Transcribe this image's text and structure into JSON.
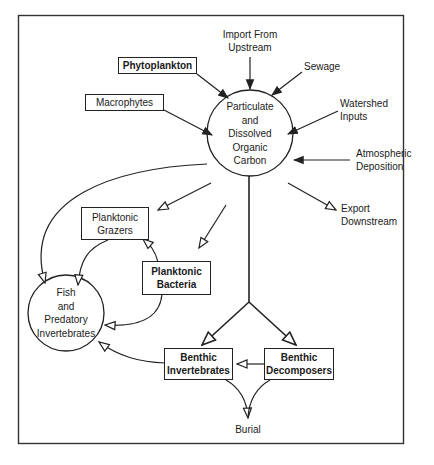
{
  "diagram": {
    "type": "flow-diagram",
    "title": "",
    "central_node": {
      "id": "poc-doc",
      "lines": [
        "Particulate",
        "and",
        "Dissolved",
        "Organic",
        "Carbon"
      ]
    },
    "consumer_node": {
      "id": "fish",
      "lines": [
        "Fish",
        "and",
        "Predatory",
        "Invertebrates"
      ]
    },
    "inputs": [
      {
        "id": "phytoplankton",
        "lines": [
          "Phytoplankton"
        ],
        "boxed": true
      },
      {
        "id": "macrophytes",
        "lines": [
          "Macrophytes"
        ],
        "boxed": true
      },
      {
        "id": "import",
        "lines": [
          "Import From",
          "Upstream"
        ],
        "boxed": false
      },
      {
        "id": "sewage",
        "lines": [
          "Sewage"
        ],
        "boxed": false
      },
      {
        "id": "watershed",
        "lines": [
          "Watershed",
          "Inputs"
        ],
        "boxed": false
      },
      {
        "id": "atmospheric",
        "lines": [
          "Atmospheric",
          "Deposition"
        ],
        "boxed": false
      }
    ],
    "outputs": [
      {
        "id": "export",
        "lines": [
          "Export",
          "Downstream"
        ],
        "boxed": false
      },
      {
        "id": "burial",
        "lines": [
          "Burial"
        ],
        "boxed": false
      }
    ],
    "compartments": [
      {
        "id": "grazers",
        "lines": [
          "Planktonic",
          "Grazers"
        ]
      },
      {
        "id": "bacteria",
        "lines": [
          "Planktonic",
          "Bacteria"
        ]
      },
      {
        "id": "benthic-invert",
        "lines": [
          "Benthic",
          "Invertebrates"
        ]
      },
      {
        "id": "benthic-decomp",
        "lines": [
          "Benthic",
          "Decomposers"
        ]
      }
    ],
    "edges": [
      {
        "from": "phytoplankton",
        "to": "poc-doc",
        "arrow": "solid"
      },
      {
        "from": "macrophytes",
        "to": "poc-doc",
        "arrow": "solid"
      },
      {
        "from": "import",
        "to": "poc-doc",
        "arrow": "solid"
      },
      {
        "from": "sewage",
        "to": "poc-doc",
        "arrow": "solid"
      },
      {
        "from": "watershed",
        "to": "poc-doc",
        "arrow": "solid"
      },
      {
        "from": "atmospheric",
        "to": "poc-doc",
        "arrow": "solid"
      },
      {
        "from": "poc-doc",
        "to": "export",
        "arrow": "open"
      },
      {
        "from": "poc-doc",
        "to": "grazers",
        "arrow": "open"
      },
      {
        "from": "poc-doc",
        "to": "bacteria",
        "arrow": "open"
      },
      {
        "from": "poc-doc",
        "to": "fish",
        "arrow": "open"
      },
      {
        "from": "poc-doc",
        "to": "benthic-invert",
        "arrow": "open"
      },
      {
        "from": "poc-doc",
        "to": "benthic-decomp",
        "arrow": "open"
      },
      {
        "from": "bacteria",
        "to": "grazers",
        "arrow": "open"
      },
      {
        "from": "grazers",
        "to": "fish",
        "arrow": "open"
      },
      {
        "from": "bacteria",
        "to": "fish",
        "arrow": "open"
      },
      {
        "from": "benthic-invert",
        "to": "fish",
        "arrow": "open"
      },
      {
        "from": "benthic-decomp",
        "to": "benthic-invert",
        "arrow": "open"
      },
      {
        "from": "benthic-invert",
        "to": "burial",
        "arrow": "open"
      },
      {
        "from": "benthic-decomp",
        "to": "burial",
        "arrow": "open"
      }
    ]
  },
  "colors": {
    "line": "#222222",
    "background": "#ffffff"
  }
}
